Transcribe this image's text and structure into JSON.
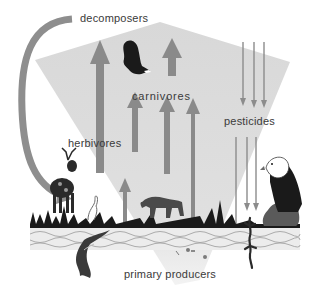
{
  "diagram": {
    "type": "food-chain bioaccumulation",
    "labels": {
      "decomposers": "decomposers",
      "carnivores": "carnivores",
      "herbivores": "herbivores",
      "pesticides": "pesticides",
      "primary_producers": "primary producers"
    },
    "organisms": [
      "eagle-flying",
      "deer",
      "wolf",
      "bald-eagle-perched",
      "fish",
      "salamander"
    ],
    "colors": {
      "cone": "#d9d9d9",
      "energy_arrow": "#8a8a8a",
      "pesticide_arrow": "#8c8c8c",
      "decomposer_arc": "#8e8e8e",
      "text": "#3a3a3a",
      "ground": "#1a1a1a",
      "water_band": "#e8e8e8"
    }
  }
}
